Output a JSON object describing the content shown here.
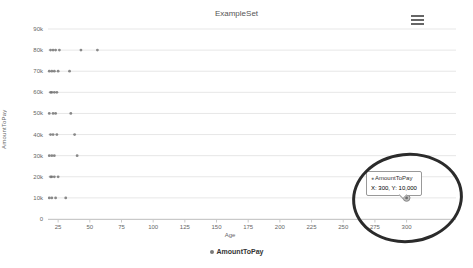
{
  "header": {
    "title": "ExampleSet"
  },
  "toolbar": {
    "menu_icon": "hamburger-menu"
  },
  "axes": {
    "y_title": "AmountToPay",
    "x_title": "Age"
  },
  "legend": {
    "label": "AmountToPay"
  },
  "tooltip": {
    "series": "AmountToPay",
    "marker": "●",
    "value": "X: 300, Y: 10,000"
  },
  "annotation": {
    "type": "ellipse",
    "color": "#2b2b2b"
  },
  "colors": {
    "point": "#6e6e6e",
    "grid": "#e7e7e7",
    "axis_line": "#c9c9c9",
    "tick_label": "#666666",
    "title": "#555555",
    "highlight_fill": "#bcbcbc",
    "highlight_stroke": "#8a8a8a"
  },
  "chart_data": {
    "type": "scatter",
    "title": "ExampleSet",
    "xlabel": "Age",
    "ylabel": "AmountToPay",
    "xlim": [
      17,
      339
    ],
    "ylim": [
      0,
      90000
    ],
    "x_ticks": [
      25,
      50,
      75,
      100,
      125,
      150,
      175,
      200,
      225,
      250,
      275,
      300
    ],
    "y_ticks": [
      0,
      10000,
      20000,
      30000,
      40000,
      50000,
      60000,
      70000,
      80000,
      90000
    ],
    "y_tick_labels": [
      "0",
      "10k",
      "20k",
      "30k",
      "40k",
      "50k",
      "60k",
      "70k",
      "80k",
      "90k"
    ],
    "grid": true,
    "legend_position": "bottom",
    "series": [
      {
        "name": "AmountToPay",
        "points": [
          [
            19,
            80000
          ],
          [
            21,
            80000
          ],
          [
            23,
            80000
          ],
          [
            26,
            80000
          ],
          [
            43,
            80000
          ],
          [
            56,
            80000
          ],
          [
            18,
            70000
          ],
          [
            20,
            70000
          ],
          [
            22,
            70000
          ],
          [
            25,
            70000
          ],
          [
            34,
            70000
          ],
          [
            19,
            60000
          ],
          [
            20,
            60000
          ],
          [
            22,
            60000
          ],
          [
            24,
            60000
          ],
          [
            18,
            50000
          ],
          [
            21,
            50000
          ],
          [
            23,
            50000
          ],
          [
            35,
            50000
          ],
          [
            19,
            40000
          ],
          [
            21,
            40000
          ],
          [
            24,
            40000
          ],
          [
            38,
            40000
          ],
          [
            18,
            30000
          ],
          [
            20,
            30000
          ],
          [
            22,
            30000
          ],
          [
            40,
            30000
          ],
          [
            19,
            20000
          ],
          [
            20,
            20000
          ],
          [
            22,
            20000
          ],
          [
            25,
            20000
          ],
          [
            18,
            10000
          ],
          [
            20,
            10000
          ],
          [
            23,
            10000
          ],
          [
            31,
            10000
          ],
          [
            300,
            10000
          ]
        ]
      }
    ],
    "highlighted_point": {
      "x": 300,
      "y": 10000,
      "tooltip": "X: 300, Y: 10,000"
    }
  }
}
